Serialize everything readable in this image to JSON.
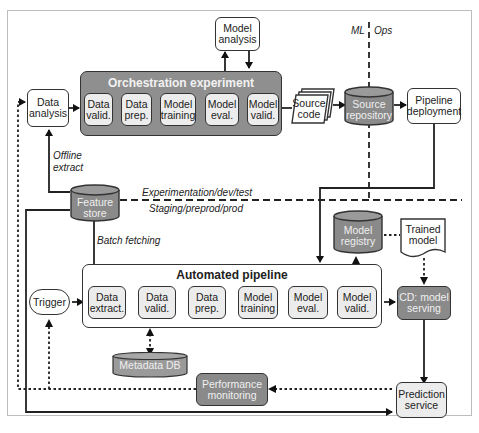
{
  "diagram": {
    "divider_labels": {
      "ml": "ML",
      "ops": "Ops",
      "upper_env": "Experimentation/dev/test",
      "lower_env": "Staging/preprod/prod"
    },
    "edge_labels": {
      "offline_extract": "Offline extract",
      "batch_fetching": "Batch fetching"
    },
    "nodes": {
      "data_analysis": "Data analysis",
      "model_analysis": "Model analysis",
      "orchestration_title": "Orchestration experiment",
      "orch_steps": [
        "Data valid.",
        "Data prep.",
        "Model training",
        "Model eval.",
        "Model valid."
      ],
      "source_code": "Source code",
      "source_repository": "Source repository",
      "pipeline_deployment": "Pipeline deployment",
      "feature_store": "Feature store",
      "model_registry": "Model registry",
      "trained_model": "Trained model",
      "automated_title": "Automated pipeline",
      "trigger": "Trigger",
      "auto_steps": [
        "Data extract.",
        "Data valid.",
        "Data prep.",
        "Model training",
        "Model eval.",
        "Model valid."
      ],
      "cd_model_serving": "CD: model serving",
      "metadata_db": "Metadata DB",
      "performance_monitoring": "Performance monitoring",
      "prediction_service": "Prediction service"
    },
    "colors": {
      "dark_fill": "#8a8a8a",
      "light_fill": "#ececec",
      "stroke": "#333333"
    }
  }
}
